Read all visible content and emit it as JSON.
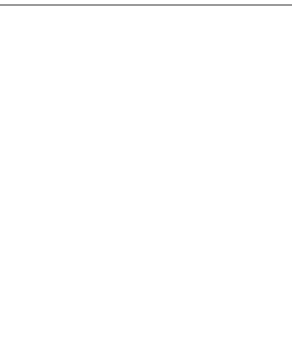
{
  "colors": {
    "header_node_fill": "#9c9c9c",
    "posting_node_fill": "#d9d9d9",
    "terminal_fill": "#111111",
    "edge": "#666666",
    "cell_border": "#777777",
    "rule": "#9a9a9a"
  },
  "top": {
    "headers": [
      {
        "label": "4",
        "items": [
          "a",
          "c"
        ]
      },
      {
        "label": "3",
        "items": [
          "a",
          "d",
          "r"
        ]
      },
      {
        "label": "1",
        "items": [
          "a",
          "b",
          "c",
          "d",
          "p",
          "q"
        ]
      }
    ],
    "terminal": "null-terminator"
  },
  "bottom": {
    "index": [
      "a",
      "b",
      "c",
      "d",
      "p",
      "q",
      "r"
    ],
    "rows": [
      {
        "key": "a",
        "nodes": [
          1,
          2,
          3
        ]
      },
      {
        "key": "b",
        "nodes": [
          3
        ]
      },
      {
        "key": "c",
        "nodes": [
          1,
          3
        ]
      },
      {
        "key": "d",
        "nodes": [
          2,
          3
        ]
      },
      {
        "key": "p",
        "nodes": [
          3
        ]
      },
      {
        "key": "q",
        "nodes": [
          3
        ]
      },
      {
        "key": "r",
        "nodes": [
          2
        ]
      }
    ]
  }
}
